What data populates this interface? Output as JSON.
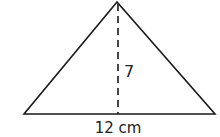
{
  "figure": {
    "type": "triangle",
    "stroke_color": "#1a1a1a",
    "background": "#ffffff",
    "vertices": {
      "apex": [
        117,
        2
      ],
      "base_left": [
        24,
        114
      ],
      "base_right": [
        215,
        114
      ]
    },
    "altitude": {
      "style": "dashed",
      "x": 118,
      "y_top": 3,
      "y_bottom": 114
    },
    "labels": {
      "height": "7",
      "base": "12 cm"
    }
  }
}
